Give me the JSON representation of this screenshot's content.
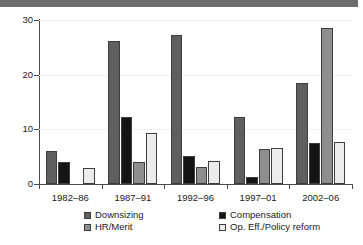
{
  "figure": {
    "header_band": "header-band"
  },
  "chart_data": {
    "type": "bar",
    "title": "",
    "subtitle": "",
    "xlabel": "",
    "ylabel": "",
    "ylim": [
      0,
      30
    ],
    "yticks": [
      0,
      10,
      20,
      30
    ],
    "ytick_labels": [
      "0",
      "10",
      "20",
      "30"
    ],
    "grid": true,
    "grid_axis": "y",
    "legend_position": "bottom",
    "categories": [
      "1982–86",
      "1987–91",
      "1992–96",
      "1997–01",
      "2002–06"
    ],
    "series": [
      {
        "name": "Downsizing",
        "color": "#5f5f5f",
        "values": [
          6.1,
          26.1,
          27.2,
          12.3,
          18.5
        ]
      },
      {
        "name": "Compensation",
        "color": "#141414",
        "values": [
          4.1,
          12.2,
          5.2,
          1.3,
          7.5
        ]
      },
      {
        "name": "HR/Merit",
        "color": "#8e8e8e",
        "values": [
          0,
          4.1,
          3.2,
          6.4,
          28.6
        ]
      },
      {
        "name": "Op. Eff./Policy reform",
        "color": "#ececec",
        "values": [
          3.0,
          9.3,
          4.2,
          6.5,
          7.6
        ]
      }
    ]
  },
  "legend": {
    "items": [
      {
        "label": "Downsizing",
        "color": "#5f5f5f"
      },
      {
        "label": "Compensation",
        "color": "#141414"
      },
      {
        "label": "HR/Merit",
        "color": "#8e8e8e"
      },
      {
        "label": "Op. Eff./Policy reform",
        "color": "#ececec"
      }
    ]
  },
  "colors": {
    "axis": "#4a4a4a",
    "gridline": "#f0efef",
    "header_band": "#6d6d6d",
    "background": "#ffffff",
    "text": "#1a1a1a"
  }
}
